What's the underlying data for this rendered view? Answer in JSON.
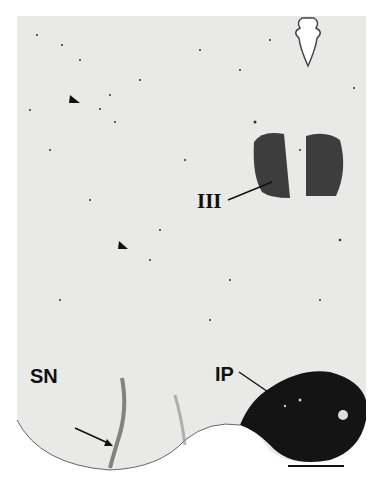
{
  "figure": {
    "type": "micrograph",
    "background_color": "#e9e9e7",
    "labels": [
      {
        "id": "III",
        "text": "III",
        "meaning": "oculomotor nucleus"
      },
      {
        "id": "SN",
        "text": "SN",
        "meaning": "substantia nigra"
      },
      {
        "id": "IP",
        "text": "IP",
        "meaning": "interpeduncular nucleus"
      }
    ],
    "markers": {
      "arrowheads": 2,
      "arrows": 1,
      "scale_bar": true
    }
  }
}
